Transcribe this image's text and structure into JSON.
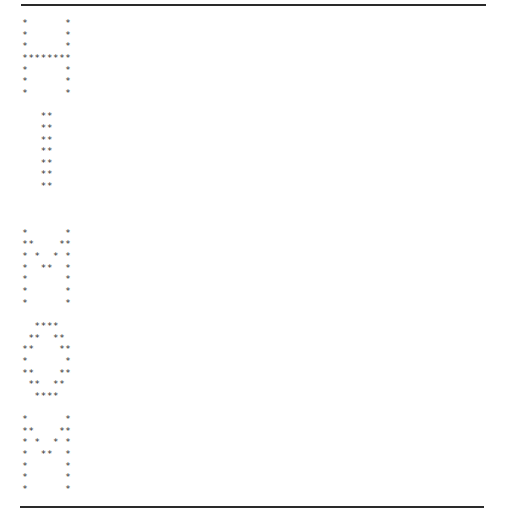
{
  "document": {
    "top_rule": true,
    "bottom_rule": true,
    "glyph": "*",
    "text_color": "#333333",
    "letters": [
      {
        "letter": "H",
        "start_row": 0,
        "rows": [
          "*      *",
          "*      *",
          "*      *",
          "********",
          "*      *",
          "*      *",
          "*      *"
        ]
      },
      {
        "letter": "I",
        "start_row": 8,
        "rows": [
          "   **   ",
          "   **   ",
          "   **   ",
          "   **   ",
          "   **   ",
          "   **   ",
          "   **   "
        ]
      },
      {
        "letter": "M",
        "start_row": 18,
        "rows": [
          "*      *",
          "**    **",
          "* *  * *",
          "*  **  *",
          "*      *",
          "*      *",
          "*      *"
        ]
      },
      {
        "letter": "O",
        "start_row": 26,
        "rows": [
          "  ****  ",
          " **  ** ",
          "**    **",
          "*      *",
          "**    **",
          " **  ** ",
          "  ****  "
        ]
      },
      {
        "letter": "M",
        "start_row": 34,
        "rows": [
          "*      *",
          "**    **",
          "* *  * *",
          "*  **  *",
          "*      *",
          "*      *",
          "*      *"
        ]
      }
    ]
  }
}
